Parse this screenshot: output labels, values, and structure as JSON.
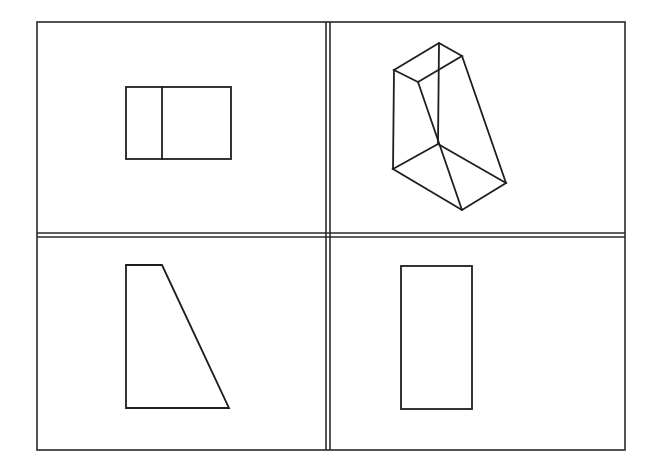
{
  "diagram": {
    "type": "orthographic-projection-views",
    "panels": [
      {
        "position": "top-left",
        "view": "top-view",
        "shape": "rectangle-with-vertical-divider"
      },
      {
        "position": "top-right",
        "view": "isometric-view",
        "shape": "truncated-prism"
      },
      {
        "position": "bottom-left",
        "view": "front-view",
        "shape": "right-trapezoid"
      },
      {
        "position": "bottom-right",
        "view": "side-view",
        "shape": "rectangle"
      }
    ],
    "colors": {
      "stroke": "#1e1e1e",
      "background": "#ffffff"
    }
  }
}
